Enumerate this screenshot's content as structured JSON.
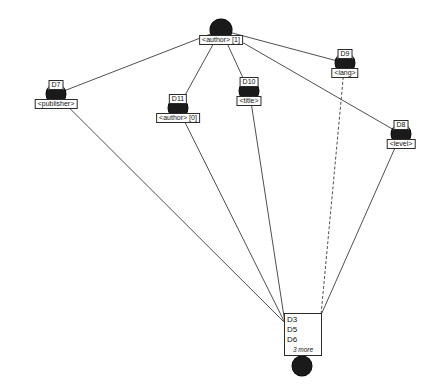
{
  "diagram": {
    "background_color": "#ffffff",
    "node_color": "#1a1a1a",
    "edge_color": "#3a3a3a",
    "label_border_color": "#2b2b2b"
  },
  "nodes": [
    {
      "id": "root",
      "name": "root-author-node",
      "id_label": "",
      "label": "<author> [1]",
      "label_position": "below",
      "x": 221,
      "y": 30,
      "r": 11
    },
    {
      "id": "D7",
      "name": "publisher-node",
      "id_label": "D7",
      "label": "<publisher>",
      "label_position": "below",
      "x": 56,
      "y": 94,
      "r": 10
    },
    {
      "id": "D11",
      "name": "author-0-node",
      "id_label": "D11",
      "label": "<author> [0]",
      "label_position": "below",
      "x": 178,
      "y": 108,
      "r": 10
    },
    {
      "id": "D10",
      "name": "title-node",
      "id_label": "D10",
      "label": "<title>",
      "label_position": "below",
      "x": 249,
      "y": 91,
      "r": 10
    },
    {
      "id": "D9",
      "name": "lang-node",
      "id_label": "D9",
      "label": "<lang>",
      "label_position": "below",
      "x": 345,
      "y": 63,
      "r": 10
    },
    {
      "id": "D8",
      "name": "level-node",
      "id_label": "D8",
      "label": "<level>",
      "label_position": "below",
      "x": 401,
      "y": 134,
      "r": 10
    },
    {
      "id": "multi",
      "name": "collapsed-documents-node",
      "id_label": "",
      "label": "",
      "label_position": "none",
      "x": 302,
      "y": 366,
      "r": 10
    }
  ],
  "multi_box": {
    "name": "collapsed-document-list",
    "x": 284,
    "y": 313,
    "width": 38,
    "height": 43,
    "lines": [
      "D3",
      "D5",
      "D6"
    ],
    "more_text": "3 more"
  },
  "edges": [
    {
      "name": "edge-root-d7",
      "from": "root",
      "to": "D7",
      "style": "solid"
    },
    {
      "name": "edge-root-d11",
      "from": "root",
      "to": "D11",
      "style": "solid"
    },
    {
      "name": "edge-root-d10",
      "from": "root",
      "to": "D10",
      "style": "solid"
    },
    {
      "name": "edge-root-d9",
      "from": "root",
      "to": "D9",
      "style": "solid"
    },
    {
      "name": "edge-root-d8",
      "from": "root",
      "to": "D8",
      "style": "solid"
    },
    {
      "name": "edge-d7-multi",
      "from": "D7",
      "to": "multi",
      "style": "solid"
    },
    {
      "name": "edge-d11-multi",
      "from": "D11",
      "to": "multi",
      "style": "solid"
    },
    {
      "name": "edge-d10-multi",
      "from": "D10",
      "to": "multi",
      "style": "solid"
    },
    {
      "name": "edge-d9-multi",
      "from": "D9",
      "to": "multi",
      "style": "dashed"
    },
    {
      "name": "edge-d8-multi",
      "from": "D8",
      "to": "multi",
      "style": "solid"
    }
  ]
}
